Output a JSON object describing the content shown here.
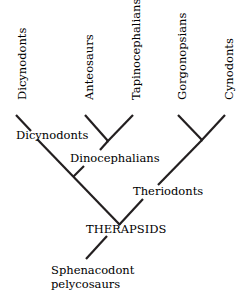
{
  "tree": {
    "title": "Therapsid phylogeny",
    "tips": [
      {
        "id": "dicynodonts",
        "label": "Dicynodonts"
      },
      {
        "id": "anteosaurs",
        "label": "Anteosaurs"
      },
      {
        "id": "tapinocephalians",
        "label": "Tapinocephalians"
      },
      {
        "id": "gorgonopsians",
        "label": "Gorgonopsians"
      },
      {
        "id": "cynodonts",
        "label": "Cynodonts"
      }
    ],
    "clades": {
      "dicynodonts": "Dicynodonts",
      "dinocephalians": "Dinocephalians",
      "theriodonts": "Theriodonts",
      "therapsids": "THERAPSIDS"
    },
    "outgroup": {
      "line1": "Sphenacodont",
      "line2": "pelycosaurs"
    },
    "colors": {
      "ink": "#231f20",
      "background": "#ffffff"
    }
  }
}
